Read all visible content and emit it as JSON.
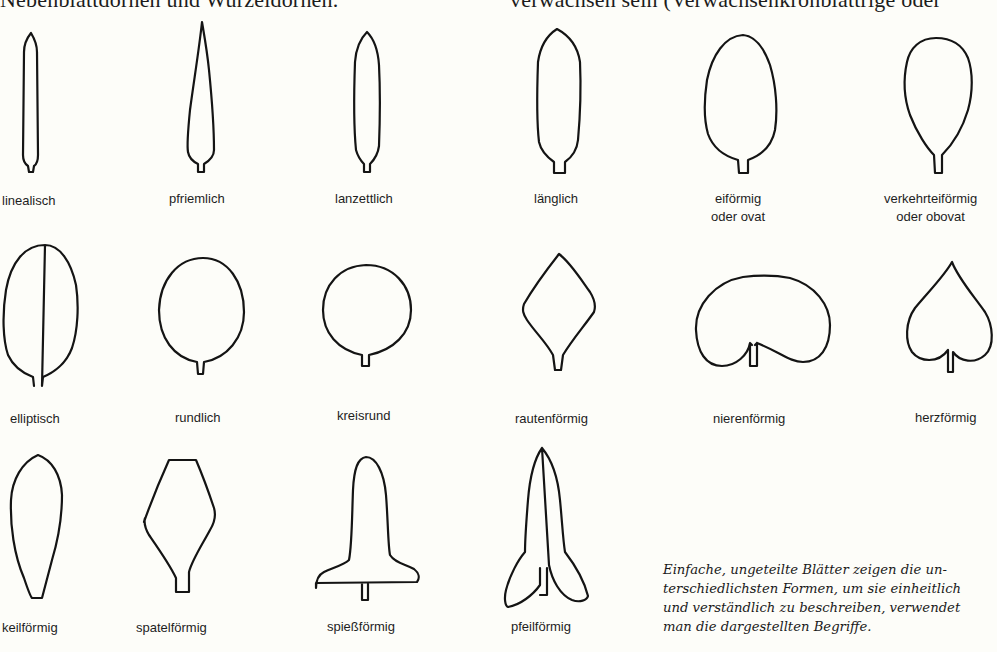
{
  "page": {
    "top_text_left": "Nebenblattdornen und Wurzeldornen.",
    "top_text_right": "verwachsen sein (Verwachsenkronblättrige oder"
  },
  "leaf_shapes": [
    {
      "id": "linealisch",
      "label": "linealisch",
      "sub": ""
    },
    {
      "id": "pfriemlich",
      "label": "pfriemlich",
      "sub": ""
    },
    {
      "id": "lanzettlich",
      "label": "lanzettlich",
      "sub": ""
    },
    {
      "id": "laenglich",
      "label": "länglich",
      "sub": ""
    },
    {
      "id": "eifoermig",
      "label": "eiförmig",
      "sub": "oder ovat"
    },
    {
      "id": "verkehrteifoermig",
      "label": "verkehrteiförmig",
      "sub": "oder obovat"
    },
    {
      "id": "elliptisch",
      "label": "elliptisch",
      "sub": ""
    },
    {
      "id": "rundlich",
      "label": "rundlich",
      "sub": ""
    },
    {
      "id": "kreisrund",
      "label": "kreisrund",
      "sub": ""
    },
    {
      "id": "rautenfoermig",
      "label": "rautenförmig",
      "sub": ""
    },
    {
      "id": "nierenfoermig",
      "label": "nierenförmig",
      "sub": ""
    },
    {
      "id": "herzfoermig",
      "label": "herzförmig",
      "sub": ""
    },
    {
      "id": "keilfoermig",
      "label": "keilförmig",
      "sub": ""
    },
    {
      "id": "spatelfoermig",
      "label": "spatelförmig",
      "sub": ""
    },
    {
      "id": "spiessfoermig",
      "label": "spießförmig",
      "sub": ""
    },
    {
      "id": "pfeilfoermig",
      "label": "pfeilförmig",
      "sub": ""
    }
  ],
  "caption": {
    "lines": [
      "Einfache, ungeteilte Blätter zeigen die un-",
      "terschiedlichsten Formen, um sie einheitlich",
      "und verständlich zu beschreiben, verwendet",
      "man die dargestellten Begriffe."
    ]
  },
  "colors": {
    "background": "#fdfdf9",
    "ink": "#141414"
  }
}
